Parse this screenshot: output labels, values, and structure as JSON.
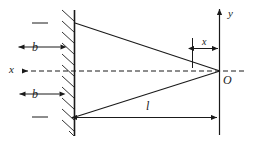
{
  "figure": {
    "type": "physics-geometry-diagram",
    "colors": {
      "background": "#ffffff",
      "stroke": "#1a1a1a",
      "hatch": "#333333"
    }
  },
  "labels": {
    "b_upper": "b",
    "b_lower": "b",
    "x_axis": "x",
    "x_offset": "x",
    "y_axis": "y",
    "origin": "O",
    "length_l": "l"
  },
  "elements": {
    "wall": {
      "name": "hatched-wall",
      "orientation": "vertical",
      "hatch_count": 11
    },
    "axis_x": {
      "name": "x-axis",
      "style": "dashed",
      "arrow": "left"
    },
    "axis_y": {
      "name": "y-axis",
      "style": "solid",
      "arrow": "up"
    },
    "ray_upper": {
      "from": "wall-top-point",
      "to": "origin"
    },
    "ray_lower": {
      "from": "wall-bottom-point",
      "to": "origin"
    },
    "dim_b_upper": {
      "name": "dimension-b-upper",
      "arrows": "both"
    },
    "dim_b_lower": {
      "name": "dimension-b-lower",
      "arrows": "both"
    },
    "dim_x": {
      "name": "dimension-x",
      "arrows": "both"
    },
    "dim_l": {
      "name": "dimension-l",
      "arrows": "both"
    }
  }
}
